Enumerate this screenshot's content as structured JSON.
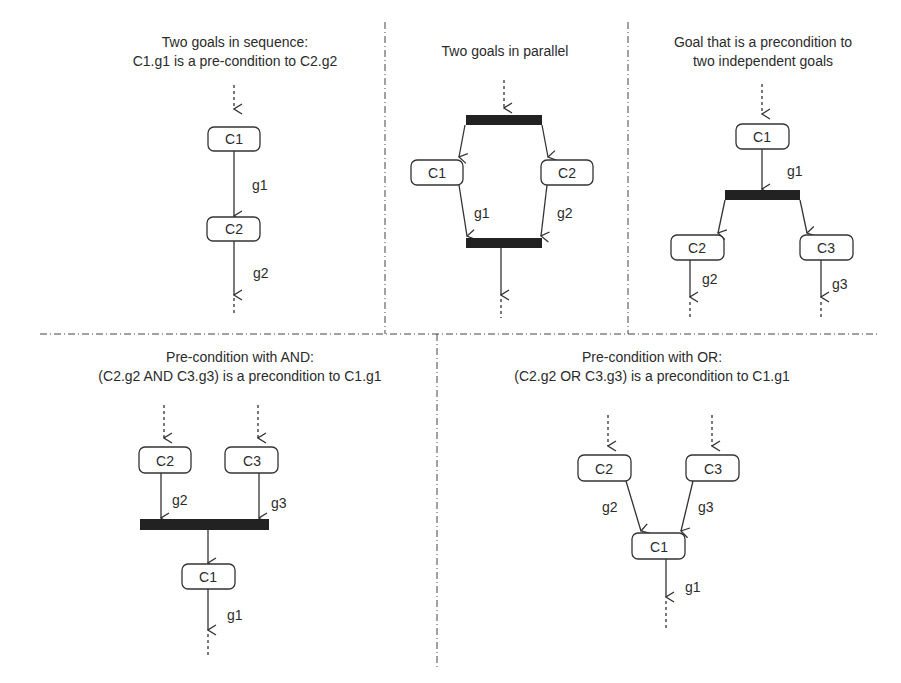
{
  "panels": {
    "sequence": {
      "title_line1": "Two goals in sequence:",
      "title_line2": "C1.g1 is a pre-condition to C2.g2",
      "nodes": [
        "C1",
        "C2"
      ],
      "edges": [
        "g1",
        "g2"
      ]
    },
    "parallel": {
      "title_line1": "Two goals in parallel",
      "nodes": [
        "C1",
        "C2"
      ],
      "edges": [
        "g1",
        "g2"
      ]
    },
    "fork": {
      "title_line1": "Goal that is a precondition to",
      "title_line2": "two independent goals",
      "nodes": [
        "C1",
        "C2",
        "C3"
      ],
      "edges": [
        "g1",
        "g2",
        "g3"
      ]
    },
    "and_join": {
      "title_line1": "Pre-condition with AND:",
      "title_line2": "(C2.g2 AND C3.g3) is a precondition to C1.g1",
      "nodes": [
        "C2",
        "C3",
        "C1"
      ],
      "edges": [
        "g2",
        "g3",
        "g1"
      ]
    },
    "or_join": {
      "title_line1": "Pre-condition with OR:",
      "title_line2": "(C2.g2 OR C3.g3) is a precondition to C1.g1",
      "nodes": [
        "C2",
        "C3",
        "C1"
      ],
      "edges": [
        "g2",
        "g3",
        "g1"
      ]
    }
  },
  "colors": {
    "line": "#333333",
    "bar": "#222222",
    "text": "#2b2b2b",
    "background": "#ffffff"
  }
}
